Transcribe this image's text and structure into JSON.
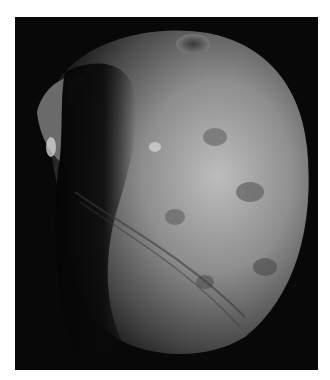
{
  "image": {
    "subject": "Phobos (moon of Mars), grayscale photograph",
    "background_color": "#ffffff",
    "frame_color": "#080808"
  }
}
